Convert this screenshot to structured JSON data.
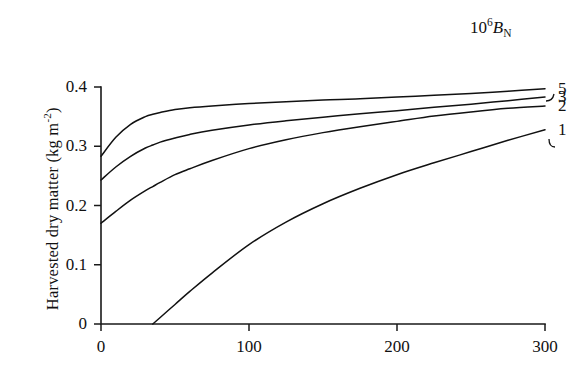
{
  "chart_data": {
    "type": "line",
    "title": "",
    "xlabel": "",
    "ylabel": "Harvested dry matter  (kg m",
    "ylabel_exponent": "-2",
    "ylabel_close": ")",
    "legend_title_base": "10",
    "legend_title_exponent": "6",
    "legend_title_symbol": "B",
    "legend_title_subscript": "N",
    "legend_position": "top-right",
    "grid": false,
    "xlim": [
      0,
      300
    ],
    "ylim": [
      0,
      0.4
    ],
    "xticks": [
      "0",
      "100",
      "200",
      "300"
    ],
    "xtick_values": [
      0,
      100,
      200,
      300
    ],
    "yticks": [
      "0",
      "0.1",
      "0.2",
      "0.3",
      "0.4"
    ],
    "ytick_values": [
      0,
      0.1,
      0.2,
      0.3,
      0.4
    ],
    "x": [
      0,
      10,
      20,
      30,
      35,
      40,
      50,
      60,
      75,
      100,
      125,
      150,
      175,
      200,
      225,
      250,
      275,
      300
    ],
    "series": [
      {
        "name": "5",
        "label": "5",
        "values": [
          0.283,
          0.315,
          0.337,
          0.35,
          0.354,
          0.357,
          0.362,
          0.365,
          0.368,
          0.372,
          0.375,
          0.378,
          0.38,
          0.383,
          0.386,
          0.389,
          0.393,
          0.397
        ]
      },
      {
        "name": "3",
        "label": "3",
        "values": [
          0.243,
          0.265,
          0.283,
          0.297,
          0.302,
          0.307,
          0.314,
          0.32,
          0.327,
          0.336,
          0.343,
          0.349,
          0.355,
          0.36,
          0.366,
          0.371,
          0.377,
          0.383
        ]
      },
      {
        "name": "2",
        "label": "2",
        "values": [
          0.17,
          0.19,
          0.209,
          0.225,
          0.232,
          0.239,
          0.252,
          0.262,
          0.276,
          0.296,
          0.311,
          0.323,
          0.333,
          0.342,
          0.351,
          0.358,
          0.364,
          0.368
        ]
      },
      {
        "name": "1",
        "label": "1",
        "values": [
          null,
          null,
          null,
          null,
          0.0,
          0.011,
          0.033,
          0.055,
          0.086,
          0.134,
          0.172,
          0.203,
          0.229,
          0.252,
          0.272,
          0.291,
          0.31,
          0.328
        ]
      }
    ]
  },
  "plot_geometry": {
    "left": 101,
    "right": 545,
    "top": 87,
    "bottom": 324
  }
}
